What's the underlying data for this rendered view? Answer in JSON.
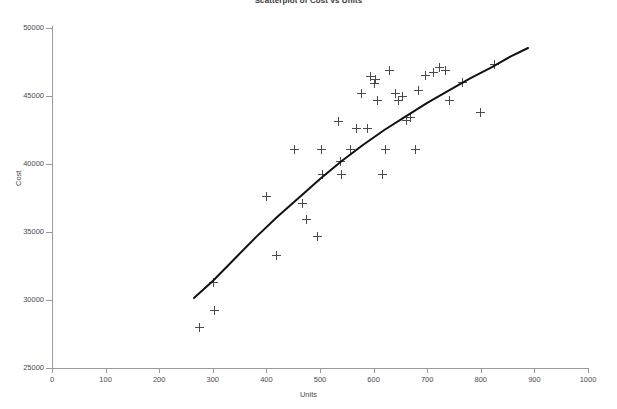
{
  "chart_data": {
    "type": "scatter",
    "title": "Scatterplot of Cost vs Units",
    "xlabel": "Units",
    "ylabel": "Cost",
    "xlim": [
      0,
      1000
    ],
    "ylim": [
      25000,
      50000
    ],
    "xticks": [
      0,
      100,
      200,
      300,
      400,
      500,
      600,
      700,
      800,
      900,
      1000
    ],
    "yticks": [
      25000,
      30000,
      35000,
      40000,
      45000,
      50000
    ],
    "grid": false,
    "legend": null,
    "marker": "plus",
    "marker_color": "#4a4a4a",
    "points": [
      {
        "x": 276,
        "y": 28000
      },
      {
        "x": 304,
        "y": 29200
      },
      {
        "x": 302,
        "y": 31300
      },
      {
        "x": 401,
        "y": 37600
      },
      {
        "x": 419,
        "y": 33300
      },
      {
        "x": 452,
        "y": 41100
      },
      {
        "x": 467,
        "y": 37100
      },
      {
        "x": 475,
        "y": 35900
      },
      {
        "x": 496,
        "y": 34700
      },
      {
        "x": 503,
        "y": 41100
      },
      {
        "x": 504,
        "y": 39200
      },
      {
        "x": 534,
        "y": 43100
      },
      {
        "x": 538,
        "y": 40200
      },
      {
        "x": 541,
        "y": 39200
      },
      {
        "x": 556,
        "y": 41100
      },
      {
        "x": 568,
        "y": 42600
      },
      {
        "x": 577,
        "y": 45200
      },
      {
        "x": 589,
        "y": 42600
      },
      {
        "x": 594,
        "y": 46400
      },
      {
        "x": 601,
        "y": 45900
      },
      {
        "x": 603,
        "y": 46200
      },
      {
        "x": 608,
        "y": 44700
      },
      {
        "x": 616,
        "y": 39200
      },
      {
        "x": 623,
        "y": 41100
      },
      {
        "x": 629,
        "y": 46900
      },
      {
        "x": 640,
        "y": 45200
      },
      {
        "x": 646,
        "y": 44700
      },
      {
        "x": 654,
        "y": 45000
      },
      {
        "x": 661,
        "y": 43200
      },
      {
        "x": 668,
        "y": 43400
      },
      {
        "x": 679,
        "y": 41100
      },
      {
        "x": 684,
        "y": 45400
      },
      {
        "x": 696,
        "y": 46500
      },
      {
        "x": 711,
        "y": 46700
      },
      {
        "x": 723,
        "y": 47100
      },
      {
        "x": 735,
        "y": 46900
      },
      {
        "x": 741,
        "y": 44700
      },
      {
        "x": 765,
        "y": 46000
      },
      {
        "x": 800,
        "y": 43800
      },
      {
        "x": 825,
        "y": 47300
      }
    ],
    "fit_curve": {
      "label": "fitted logarithmic trend",
      "color": "#111111",
      "x_start": 265,
      "x_end": 888,
      "y_start": 30140,
      "y_end": 48530,
      "points": [
        {
          "x": 265,
          "y": 30140
        },
        {
          "x": 300,
          "y": 31400
        },
        {
          "x": 340,
          "y": 33000
        },
        {
          "x": 380,
          "y": 34600
        },
        {
          "x": 420,
          "y": 36100
        },
        {
          "x": 460,
          "y": 37500
        },
        {
          "x": 500,
          "y": 38900
        },
        {
          "x": 540,
          "y": 40200
        },
        {
          "x": 580,
          "y": 41400
        },
        {
          "x": 620,
          "y": 42500
        },
        {
          "x": 660,
          "y": 43500
        },
        {
          "x": 700,
          "y": 44500
        },
        {
          "x": 740,
          "y": 45400
        },
        {
          "x": 780,
          "y": 46300
        },
        {
          "x": 820,
          "y": 47100
        },
        {
          "x": 855,
          "y": 47900
        },
        {
          "x": 888,
          "y": 48530
        }
      ]
    }
  }
}
